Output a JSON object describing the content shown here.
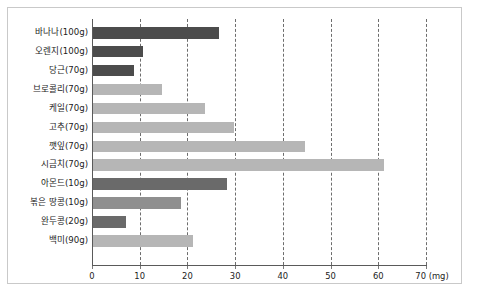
{
  "chart_data": {
    "type": "bar",
    "orientation": "horizontal",
    "title": "",
    "xlabel": "(mg)",
    "ylabel": "",
    "xlim": [
      0,
      70
    ],
    "xticks": [
      0,
      10,
      20,
      30,
      40,
      50,
      60,
      70
    ],
    "xtick_labels": [
      "0",
      "10",
      "20",
      "30",
      "40",
      "50",
      "60",
      "70 (mg)"
    ],
    "grid": "vertical dashed gridlines at every 10 mg",
    "legend": "none",
    "categories": [
      "바나나(100g)",
      "오렌지(100g)",
      "당근(70g)",
      "브로콜리(70g)",
      "케일(70g)",
      "고추(70g)",
      "깻잎(70g)",
      "시금치(70g)",
      "아몬드(10g)",
      "볶은 땅콩(10g)",
      "완두콩(20g)",
      "백미(90g)"
    ],
    "values": [
      26.5,
      10.5,
      8.5,
      14.5,
      23.5,
      29.5,
      44.5,
      61,
      28,
      18.5,
      7,
      21
    ],
    "bar_colors": [
      "#4c4c4c",
      "#4c4c4c",
      "#4c4c4c",
      "#b6b6b6",
      "#b6b6b6",
      "#b6b6b6",
      "#b6b6b6",
      "#b6b6b6",
      "#6a6a6a",
      "#8f8f8f",
      "#6a6a6a",
      "#b6b6b6"
    ],
    "colors": {
      "dark_bar": "#4c4c4c",
      "mid_bar": "#6a6a6a",
      "light_bar": "#b6b6b6",
      "gridline": "#6d6d6d",
      "axis": "#5a5a5a",
      "frame": "#c9c9c9",
      "background": "#ffffff",
      "text": "#1c1c1c"
    }
  }
}
